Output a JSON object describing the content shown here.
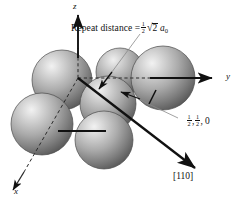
{
  "figure": {
    "kind": "crystal-structure-diagram",
    "background_color": "#ffffff",
    "width": 244,
    "height": 201
  },
  "axes": {
    "z_label": "z",
    "y_label": "y",
    "x_label": "x",
    "origin": {
      "x": 78,
      "y": 78
    },
    "z_tip": {
      "x": 78,
      "y": 13
    },
    "y_tip": {
      "x": 214,
      "y": 78
    },
    "x_tip": {
      "x": 11,
      "y": 186
    },
    "axis_color": "#111111"
  },
  "annotations": {
    "repeat_distance": {
      "prefix": "Repeat distance =",
      "fraction_numerator": "1",
      "fraction_denominator": "2",
      "radical": "√",
      "radicand": "2",
      "variable": "a",
      "variable_subscript": "0",
      "full_text": "Repeat distance = 1/2 √2 a₀"
    },
    "site_coordinates": {
      "first_numerator": "1",
      "first_denominator": "2",
      "separator_1": ",",
      "second_numerator": "1",
      "second_denominator": "2",
      "separator_2": ",",
      "third": "0",
      "full_text": "1/2, 1/2, 0"
    },
    "direction": {
      "label": "[110]"
    }
  },
  "atoms": {
    "sphere_fill_light": "#e4e4e4",
    "sphere_fill_mid": "#a8a8a8",
    "sphere_fill_dark": "#5e5e5e",
    "sphere_edge": "#4a4a4a",
    "count": 6,
    "list": [
      {
        "name": "corner-top-left",
        "cx": 62,
        "cy": 80,
        "r": 30
      },
      {
        "name": "corner-top-right",
        "cx": 163,
        "cy": 78,
        "r": 32
      },
      {
        "name": "face-center",
        "cx": 108,
        "cy": 104,
        "r": 28
      },
      {
        "name": "corner-bottom-left",
        "cx": 42,
        "cy": 124,
        "r": 31
      },
      {
        "name": "corner-bottom-mid",
        "cx": 104,
        "cy": 140,
        "r": 29
      },
      {
        "name": "back-upper",
        "cx": 120,
        "cy": 72,
        "r": 24
      }
    ]
  },
  "markers": {
    "bond_tick_horizontal": {
      "x1": 58,
      "y1": 131,
      "x2": 106,
      "y2": 131
    },
    "bond_tick_diagonal": {
      "x1": 156,
      "y1": 91,
      "x2": 149,
      "y2": 103
    },
    "repeat_leader": {
      "x1": 137,
      "y1": 36,
      "x2": 101,
      "y2": 86
    },
    "coord_leader": {
      "x1": 175,
      "y1": 119,
      "x2": 125,
      "y2": 95
    }
  }
}
